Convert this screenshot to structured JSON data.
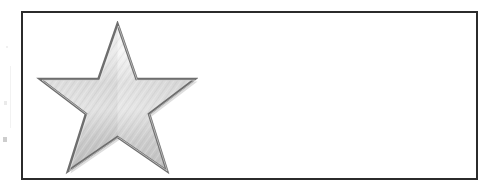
{
  "figure": {
    "background_color": "#ffffff",
    "border_color": "#2b2b2b",
    "border_width_px": 2,
    "box": {
      "x": 21,
      "y": 11,
      "width": 457,
      "height": 169
    },
    "caption": "",
    "empty_area_label": ""
  },
  "star": {
    "name": "five-pointed-star",
    "points": 5,
    "fill_style": "brushed-metal-silver-gradient",
    "outline_color": "#6e6e6e",
    "outline_width_px": 2,
    "highlight_color": "#f2f2f2",
    "midtone_color": "#d2d2d2",
    "shadow_color": "#a8a8a8",
    "position": {
      "x": 32,
      "y": 21,
      "width": 148,
      "height": 154
    },
    "rotation_deg": 0,
    "label": "Silver star"
  },
  "artifacts": {
    "label": "scan-margin-marks",
    "color": "#d9d9d9",
    "count": 4
  },
  "chart_data": {
    "type": "table",
    "title": "",
    "columns": [
      "Symbol",
      "Description"
    ],
    "rows": [
      [
        "Silver star",
        ""
      ]
    ]
  }
}
